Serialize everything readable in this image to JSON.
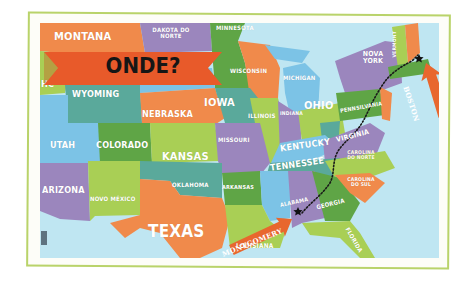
{
  "map": {
    "title": "ONDE?",
    "colors": {
      "frame_border": "#b9d36a",
      "water": "#bfe6f2",
      "banner": "#e85a2a",
      "banner_text": "#161616",
      "orange": "#f08a4b",
      "purple": "#9b86bd",
      "green": "#5fa546",
      "light_green": "#a9cf55",
      "teal": "#5aa99b",
      "blue": "#7cc3e6",
      "route": "#1a1a1a",
      "arrow": "#e8672e"
    },
    "states": [
      {
        "id": "montana",
        "label": "MONTANA"
      },
      {
        "id": "north-dakota",
        "label": "DAKOTA DO NORTE"
      },
      {
        "id": "minnesota",
        "label": "MINNESOTA"
      },
      {
        "id": "wisconsin",
        "label": "WISCONSIN"
      },
      {
        "id": "michigan",
        "label": "MICHIGAN"
      },
      {
        "id": "new-york",
        "label": "NOVA YORK"
      },
      {
        "id": "vermont",
        "label": "VERMONT"
      },
      {
        "id": "idaho-partial",
        "label": "HC"
      },
      {
        "id": "wyoming",
        "label": "WYOMING"
      },
      {
        "id": "iowa",
        "label": "IOWA"
      },
      {
        "id": "nebraska",
        "label": "NEBRASKA"
      },
      {
        "id": "illinois",
        "label": "ILLINOIS"
      },
      {
        "id": "indiana",
        "label": "INDIANA"
      },
      {
        "id": "ohio",
        "label": "OHIO"
      },
      {
        "id": "pennsylvania",
        "label": "PENNSILVANIA"
      },
      {
        "id": "utah",
        "label": "UTAH"
      },
      {
        "id": "colorado",
        "label": "COLORADO"
      },
      {
        "id": "kansas",
        "label": "KANSAS"
      },
      {
        "id": "missouri",
        "label": "MISSOURI"
      },
      {
        "id": "kentucky",
        "label": "KENTUCKY"
      },
      {
        "id": "virginia",
        "label": "VIRGINIA"
      },
      {
        "id": "tennessee",
        "label": "TENNESSEE"
      },
      {
        "id": "north-carolina",
        "label": "CAROLINA DO NORTE"
      },
      {
        "id": "arizona",
        "label": "ARIZONA"
      },
      {
        "id": "new-mexico",
        "label": "NOVO MÉXICO"
      },
      {
        "id": "oklahoma",
        "label": "OKLAHOMA"
      },
      {
        "id": "arkansas",
        "label": "ARKANSAS"
      },
      {
        "id": "mississippi",
        "label": "MISSISSIPPI"
      },
      {
        "id": "alabama",
        "label": "ALABAMA"
      },
      {
        "id": "georgia",
        "label": "GEORGIA"
      },
      {
        "id": "south-carolina",
        "label": "CAROLINA DO SUL"
      },
      {
        "id": "texas",
        "label": "TEXAS"
      },
      {
        "id": "louisiana",
        "label": "LOUISIANA"
      },
      {
        "id": "florida",
        "label": "FLORIDA"
      }
    ],
    "markers": [
      {
        "id": "boston",
        "label": "BOSTON",
        "icon": "star-icon"
      },
      {
        "id": "montgomery",
        "label": "MONTGOMERY",
        "icon": "star-icon"
      }
    ],
    "route": {
      "from": "MONTGOMERY",
      "to": "BOSTON",
      "style": "dotted"
    }
  }
}
